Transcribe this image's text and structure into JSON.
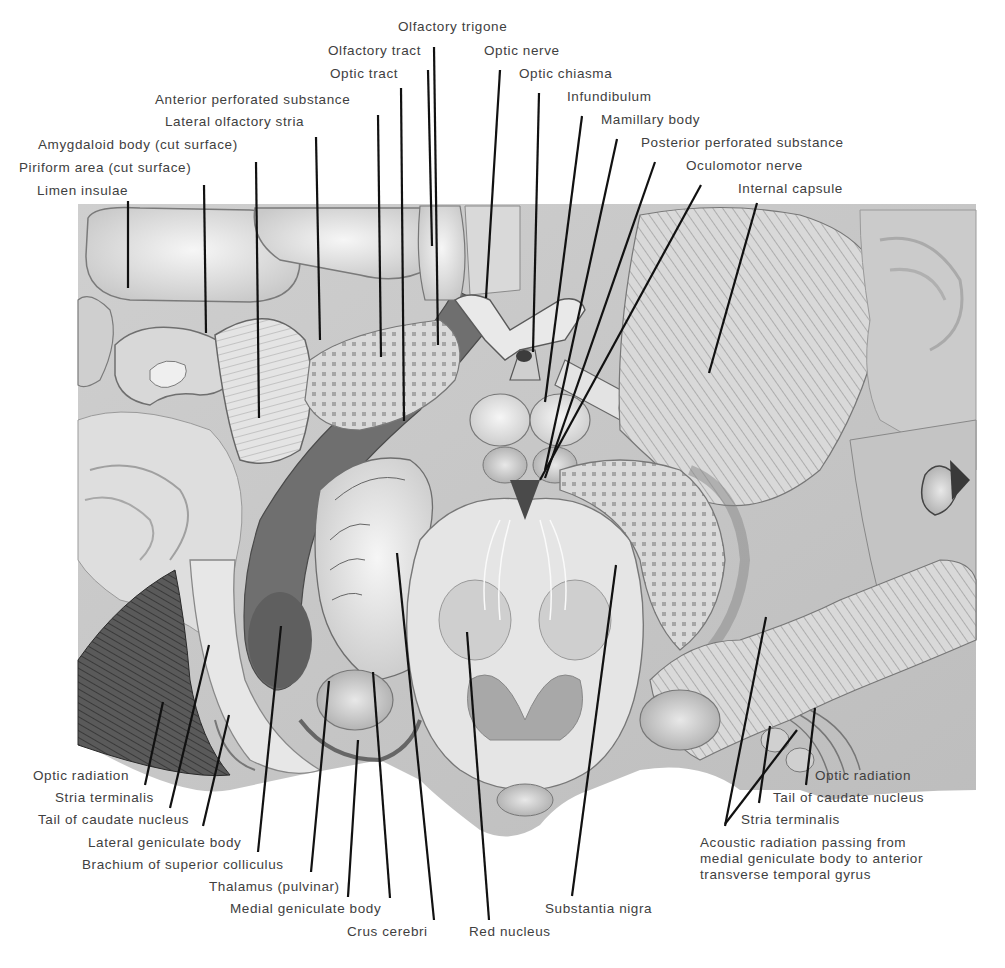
{
  "figure": {
    "type": "anatomical illustration",
    "colors": {
      "background": "#ffffff",
      "panel": "#d4d4d4",
      "dark_tract": "#6e6e6e",
      "light_tissue": "#e6e6e6",
      "leader_line": "#111111",
      "label_text": "#404040"
    }
  },
  "labels_top": [
    {
      "text": "Olfactory trigone",
      "x": 398,
      "y": 19,
      "anchor": [
        434,
        47
      ],
      "target": [
        438,
        345
      ]
    },
    {
      "text": "Olfactory tract",
      "x": 328,
      "y": 43,
      "anchor": [
        428,
        70
      ],
      "target": [
        432,
        246
      ]
    },
    {
      "text": "Optic nerve",
      "x": 484,
      "y": 43,
      "anchor": [
        500,
        70
      ],
      "target": [
        486,
        298
      ]
    },
    {
      "text": "Optic tract",
      "x": 330,
      "y": 66,
      "anchor": [
        401,
        88
      ],
      "target": [
        404,
        421
      ]
    },
    {
      "text": "Optic chiasma",
      "x": 519,
      "y": 66,
      "anchor": [
        539,
        93
      ],
      "target": [
        533,
        352
      ]
    },
    {
      "text": "Anterior perforated substance",
      "x": 155,
      "y": 92,
      "anchor": [
        378,
        115
      ],
      "target": [
        381,
        357
      ]
    },
    {
      "text": "Infundibulum",
      "x": 567,
      "y": 89,
      "anchor": [
        582,
        116
      ],
      "target": [
        545,
        402
      ]
    },
    {
      "text": "Lateral olfactory stria",
      "x": 165,
      "y": 114,
      "anchor": [
        316,
        137
      ],
      "target": [
        320,
        340
      ]
    },
    {
      "text": "Mamillary body",
      "x": 601,
      "y": 112,
      "anchor": [
        617,
        139
      ],
      "target": [
        545,
        470
      ]
    },
    {
      "text": "Amygdaloid body (cut surface)",
      "x": 38,
      "y": 137,
      "anchor": [
        256,
        162
      ],
      "target": [
        259,
        418
      ]
    },
    {
      "text": "Posterior perforated substance",
      "x": 641,
      "y": 135,
      "anchor": [
        655,
        162
      ],
      "target": [
        545,
        478
      ]
    },
    {
      "text": "Piriform area (cut surface)",
      "x": 19,
      "y": 160,
      "anchor": [
        204,
        185
      ],
      "target": [
        206,
        333
      ]
    },
    {
      "text": "Oculomotor nerve",
      "x": 686,
      "y": 158,
      "anchor": [
        701,
        185
      ],
      "target": [
        540,
        480
      ]
    },
    {
      "text": "Limen insulae",
      "x": 37,
      "y": 183,
      "anchor": [
        128,
        201
      ],
      "target": [
        128,
        288
      ]
    },
    {
      "text": "Internal capsule",
      "x": 738,
      "y": 181,
      "anchor": [
        757,
        203
      ],
      "target": [
        709,
        373
      ]
    }
  ],
  "labels_bottom_left": [
    {
      "text": "Optic radiation",
      "x": 33,
      "y": 768,
      "anchor": [
        145,
        785
      ],
      "target": [
        163,
        702
      ]
    },
    {
      "text": "Stria terminalis",
      "x": 55,
      "y": 790,
      "anchor": [
        170,
        808
      ],
      "target": [
        209,
        645
      ]
    },
    {
      "text": "Tail of caudate nucleus",
      "x": 38,
      "y": 812,
      "anchor": [
        203,
        826
      ],
      "target": [
        229,
        715
      ]
    },
    {
      "text": "Lateral geniculate body",
      "x": 88,
      "y": 835,
      "anchor": [
        258,
        852
      ],
      "target": [
        281,
        626
      ]
    },
    {
      "text": "Brachium of superior colliculus",
      "x": 82,
      "y": 857,
      "anchor": [
        311,
        872
      ],
      "target": [
        329,
        681
      ]
    },
    {
      "text": "Thalamus (pulvinar)",
      "x": 209,
      "y": 879,
      "anchor": [
        348,
        897
      ],
      "target": [
        358,
        740
      ]
    },
    {
      "text": "Medial geniculate body",
      "x": 230,
      "y": 901,
      "anchor": [
        390,
        898
      ],
      "target": [
        373,
        672
      ]
    },
    {
      "text": "Crus cerebri",
      "x": 347,
      "y": 924,
      "anchor": [
        434,
        920
      ],
      "target": [
        397,
        553
      ]
    },
    {
      "text": "Red nucleus",
      "x": 469,
      "y": 924,
      "anchor": [
        489,
        920
      ],
      "target": [
        467,
        632
      ]
    }
  ],
  "labels_bottom_right": [
    {
      "text": "Substantia nigra",
      "x": 545,
      "y": 901,
      "anchor": [
        572,
        896
      ],
      "target": [
        616,
        565
      ]
    },
    {
      "text": "Optic radiation",
      "x": 815,
      "y": 768,
      "anchor": [
        806,
        785
      ],
      "target": [
        815,
        708
      ]
    },
    {
      "text": "Tail of caudate nucleus",
      "x": 773,
      "y": 790,
      "anchor": [
        759,
        803
      ],
      "target": [
        770,
        726
      ]
    },
    {
      "text": "Stria terminalis",
      "x": 741,
      "y": 812,
      "anchor": [
        725,
        824
      ],
      "target": [
        797,
        730
      ]
    },
    {
      "text": "Acoustic radiation passing from\nmedial geniculate body to anterior\ntransverse temporal gyrus",
      "x": 700,
      "y": 835,
      "anchor": [
        725,
        826
      ],
      "target": [
        766,
        617
      ]
    }
  ]
}
